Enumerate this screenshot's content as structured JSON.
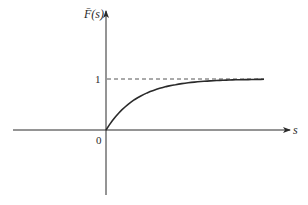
{
  "chart_data": {
    "type": "line",
    "title": "",
    "ylabel": "F̄(s)",
    "xlabel": "s",
    "origin_label": "0",
    "y_tick_labels": [
      "1"
    ],
    "asymptote": {
      "y": 1,
      "style": "dashed"
    },
    "series": [
      {
        "name": "F̄(s)",
        "x": [
          0,
          0.5,
          1,
          1.5,
          2,
          2.5,
          3,
          3.5,
          4,
          4.5,
          5
        ],
        "values": [
          0,
          0.39,
          0.63,
          0.78,
          0.86,
          0.92,
          0.95,
          0.97,
          0.98,
          0.99,
          0.99
        ]
      }
    ],
    "xlim": [
      -2.9,
      5.7
    ],
    "ylim": [
      -1.3,
      2.3
    ],
    "grid": false,
    "legend": "none"
  },
  "labels": {
    "y_axis": "F̄(s)",
    "x_axis": "s",
    "origin": "0",
    "one": "1"
  },
  "colors": {
    "axis": "#2a2a2a",
    "curve": "#2a2a2a",
    "dashed": "#555555"
  }
}
